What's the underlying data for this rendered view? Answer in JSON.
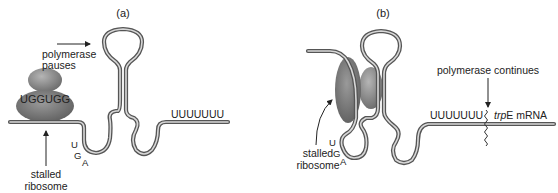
{
  "panels": [
    {
      "label": "(a)",
      "annotations": {
        "polymerase": [
          "polymerase",
          "pauses"
        ],
        "ribosome": [
          "stalled",
          "ribosome"
        ],
        "ribosome_codons": "UGGUGG",
        "stop_codon": [
          "U",
          "G",
          "A"
        ],
        "poly_u": "UUUUUUU"
      }
    },
    {
      "label": "(b)",
      "annotations": {
        "polymerase": "polymerase continues",
        "ribosome": [
          "stalled",
          "ribosome"
        ],
        "stop_codon": [
          "U",
          "G",
          "A"
        ],
        "poly_u": "UUUUUUU",
        "gene_italic": "trp",
        "gene_suffix": "E mRNA"
      }
    }
  ],
  "colors": {
    "rna_outline": "#555555",
    "rna_core": "#d8d8d8",
    "ribosome_dark": "#6e6e6e",
    "ribosome_light": "#a8a8a8",
    "text": "#222222"
  }
}
